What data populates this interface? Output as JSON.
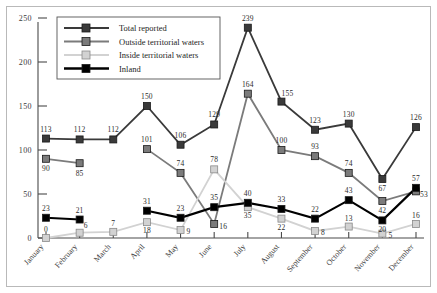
{
  "chart_data": {
    "type": "line",
    "title": "",
    "xlabel": "",
    "ylabel": "",
    "ylim": [
      0,
      250
    ],
    "yticks": [
      0,
      50,
      100,
      150,
      200,
      250
    ],
    "grid": false,
    "legend_position": "top-left",
    "categories": [
      "January",
      "February",
      "March",
      "April",
      "May",
      "June",
      "July",
      "August",
      "September",
      "October",
      "November",
      "December"
    ],
    "series": [
      {
        "name": "Total reported",
        "color": "#3a3a3a",
        "values": [
          113,
          112,
          112,
          150,
          106,
          129,
          239,
          155,
          123,
          130,
          67,
          126
        ]
      },
      {
        "name": "Outside territorial waters",
        "color": "#7b7b7b",
        "values": [
          90,
          85,
          null,
          101,
          74,
          16,
          164,
          100,
          93,
          74,
          42,
          53
        ]
      },
      {
        "name": "Inside territorial waters",
        "color": "#d2d2d2",
        "values": [
          0,
          6,
          7,
          18,
          9,
          78,
          35,
          22,
          8,
          13,
          5,
          16
        ]
      },
      {
        "name": "Inland",
        "color": "#000000",
        "values": [
          23,
          21,
          null,
          31,
          23,
          35,
          40,
          33,
          22,
          43,
          20,
          57
        ]
      }
    ]
  },
  "legend": {
    "entries": [
      {
        "label": "Total reported"
      },
      {
        "label": "Outside territorial waters"
      },
      {
        "label": "Inside territorial waters"
      },
      {
        "label": "Inland"
      }
    ]
  },
  "axis": {
    "y_tick_labels": [
      "250",
      "200",
      "150",
      "100",
      "50",
      "0"
    ],
    "x_tick_labels": [
      "January",
      "February",
      "March",
      "April",
      "May",
      "June",
      "July",
      "August",
      "September",
      "October",
      "November",
      "December"
    ]
  }
}
